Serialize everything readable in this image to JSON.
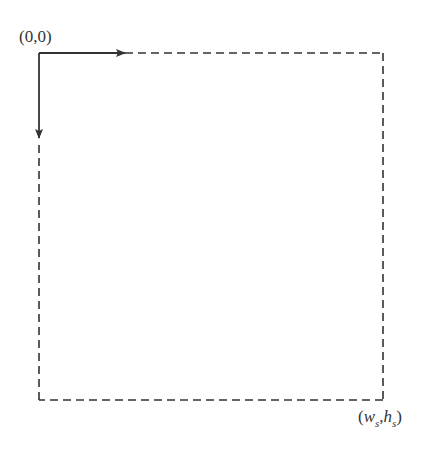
{
  "diagram": {
    "colors": {
      "stroke": "#333333",
      "background": "#ffffff"
    },
    "origin_label": "(0,0)",
    "corner_label": {
      "open": "(",
      "w": "w",
      "s1": "s",
      "comma": ",",
      "h": "h",
      "s2": "s",
      "close": ")"
    },
    "elements": [
      "dashed-screen-rectangle",
      "x-axis-arrow",
      "y-axis-arrow"
    ]
  }
}
